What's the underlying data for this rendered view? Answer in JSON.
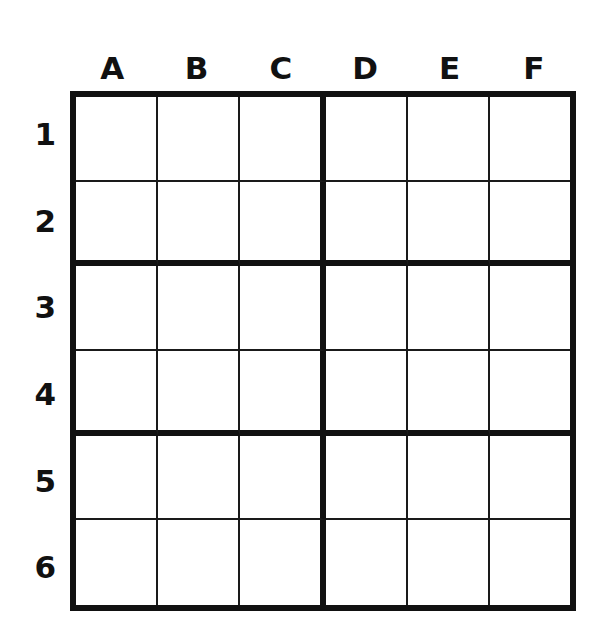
{
  "puzzle": {
    "kind": "sudoku-grid",
    "title": "6x6 Sudoku Grid",
    "columns": 6,
    "rows": 6,
    "box_width": 3,
    "box_height": 2,
    "line_color": "#111111",
    "thin_line_color": "#1a1a1a",
    "cell_background": "#ffffff",
    "page_background": "#ffffff",
    "column_labels": [
      "A",
      "B",
      "C",
      "D",
      "E",
      "F"
    ],
    "row_labels": [
      "1",
      "2",
      "3",
      "4",
      "5",
      "6"
    ],
    "cells": [
      [
        "",
        "",
        "",
        "",
        "",
        ""
      ],
      [
        "",
        "",
        "",
        "",
        "",
        ""
      ],
      [
        "",
        "",
        "",
        "",
        "",
        ""
      ],
      [
        "",
        "",
        "",
        "",
        "",
        ""
      ],
      [
        "",
        "",
        "",
        "",
        "",
        ""
      ],
      [
        "",
        "",
        "",
        "",
        "",
        ""
      ]
    ]
  }
}
